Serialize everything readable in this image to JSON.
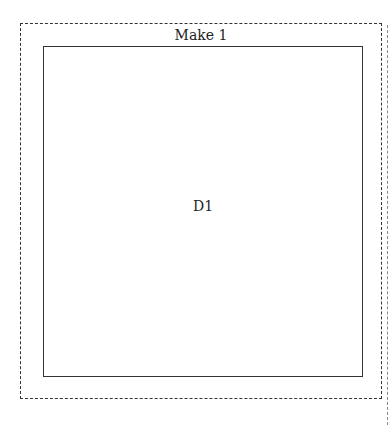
{
  "diagram": {
    "outer_frame": {
      "title": "Make 1",
      "border_style": "dashed",
      "border_color": "#333333"
    },
    "inner_box": {
      "label": "D1",
      "border_style": "solid",
      "border_color": "#333333"
    }
  }
}
